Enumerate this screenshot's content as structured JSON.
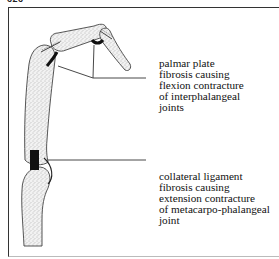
{
  "figure": {
    "number": "626"
  },
  "labels": {
    "interphalangeal": {
      "lines": [
        "palmar plate",
        "fibrosis causing",
        "flexion contracture",
        "of interphalangeal",
        "joints"
      ]
    },
    "metacarpophalangeal": {
      "lines": [
        "collateral ligament",
        "fibrosis causing",
        "extension contracture",
        "of metacarpo-phalangeal",
        "joint"
      ]
    }
  },
  "colors": {
    "bone_fill": "#e6e6e6",
    "outline": "#444444",
    "ligament": "#111111",
    "leader_line": "#333333"
  }
}
